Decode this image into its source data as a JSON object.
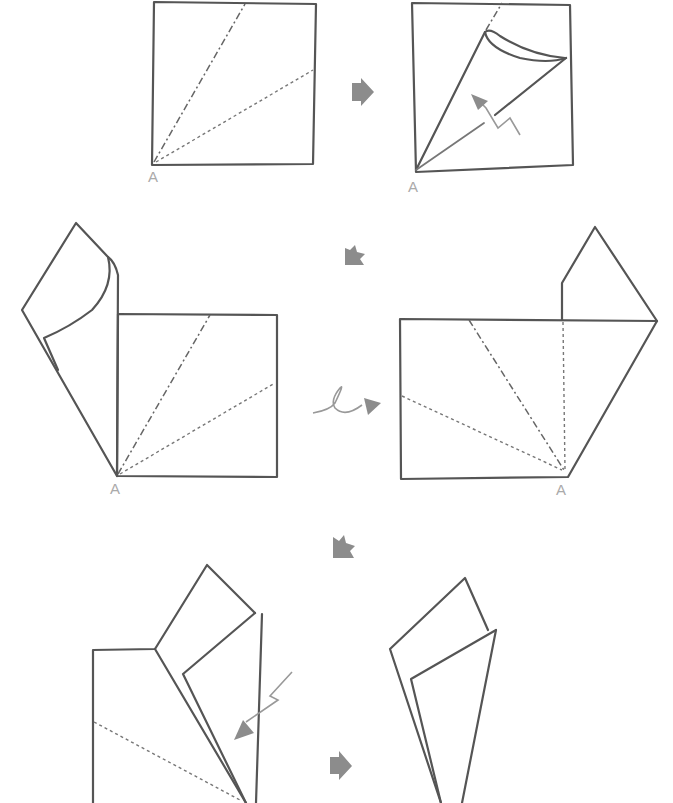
{
  "diagram": {
    "type": "origami-folding-instructions",
    "style": "hand-drawn pencil",
    "colors": {
      "line": "#555555",
      "arrow": "#8c8c8c",
      "label": "#aaaaaa",
      "background": "#ffffff"
    },
    "labels": {
      "corner": "A"
    },
    "steps": [
      {
        "id": 1,
        "description": "Square with mountain fold line and valley fold line from corner A"
      },
      {
        "id": 2,
        "description": "Fold edge toward the center crease (valley fold) from corner A"
      },
      {
        "id": 3,
        "description": "Left flap folded out; square with fold lines from corner A"
      },
      {
        "id": 4,
        "description": "Turn the model over; flap at upper right"
      },
      {
        "id": 5,
        "description": "Fold flap inward along the crease"
      },
      {
        "id": 6,
        "description": "Finished cone shape"
      }
    ],
    "arrows": [
      {
        "icon": "next-step-arrow-right",
        "between": [
          1,
          2
        ]
      },
      {
        "icon": "next-step-arrow-down-left",
        "between": [
          2,
          3
        ]
      },
      {
        "icon": "turn-over-arrow",
        "between": [
          3,
          4
        ]
      },
      {
        "icon": "next-step-arrow-down-left",
        "between": [
          4,
          5
        ]
      },
      {
        "icon": "next-step-arrow-right",
        "between": [
          5,
          6
        ]
      }
    ]
  }
}
